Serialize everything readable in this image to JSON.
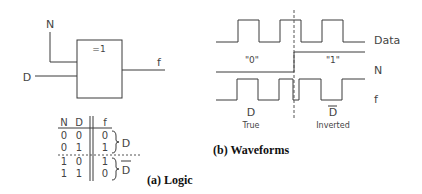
{
  "logic_gate": {
    "symbol": "=1",
    "input_n": "N",
    "input_d": "D",
    "output": "f"
  },
  "truth_table": {
    "headers": [
      "N",
      "D",
      "f"
    ],
    "rows": [
      [
        "0",
        "0",
        "0"
      ],
      [
        "0",
        "1",
        "1"
      ],
      [
        "1",
        "0",
        "1"
      ],
      [
        "1",
        "1",
        "0"
      ]
    ],
    "group_labels": [
      "D",
      "D̅"
    ],
    "group_top_label": "D",
    "group_bottom_label": "D"
  },
  "caption_a": "(a)  Logic",
  "waveforms": {
    "signals": [
      "Data",
      "N",
      "f"
    ],
    "signal_data": "Data",
    "signal_n": "N",
    "signal_f": "f",
    "region_left_value": "\"0\"",
    "region_right_value": "\"1\"",
    "left_output_label": "D",
    "left_output_caption": "True",
    "right_output_label": "D",
    "right_output_caption": "Inverted"
  },
  "caption_b": "(b)  Waveforms"
}
